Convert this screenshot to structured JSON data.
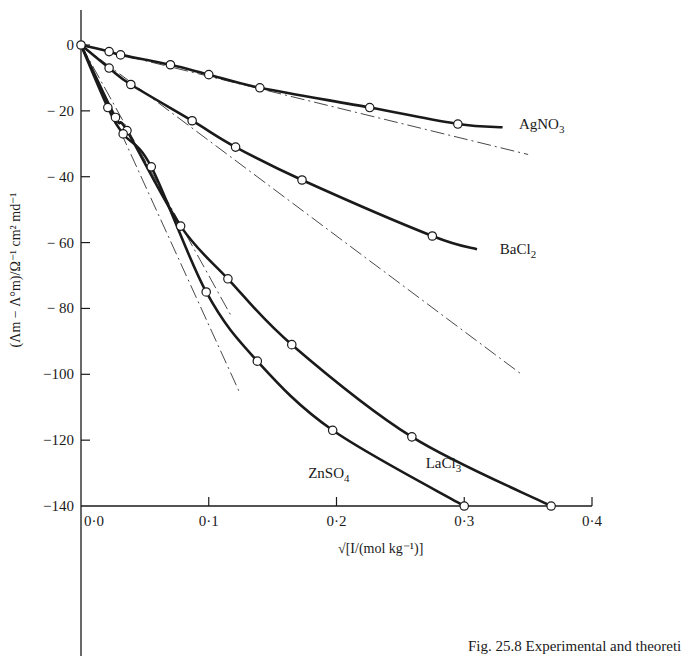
{
  "chart_data": {
    "type": "line",
    "title": "",
    "xlabel": "√[I/(mol kg⁻¹)]",
    "ylabel": "(Λm − Λ°m)/Ω⁻¹ cm² md⁻¹",
    "xlim": [
      0.0,
      0.4
    ],
    "ylim": [
      -140,
      0
    ],
    "x_ticks": [
      0.0,
      0.1,
      0.2,
      0.3,
      0.4
    ],
    "x_tick_labels": [
      "0·0",
      "0·1",
      "0·2",
      "0·3",
      "0·4"
    ],
    "y_ticks": [
      0,
      -20,
      -40,
      -60,
      -80,
      -100,
      -120,
      -140
    ],
    "y_tick_labels": [
      "0",
      "− 20",
      "− 40",
      "− 60",
      "− 80",
      "−100",
      "−120",
      "−140"
    ],
    "grid": false,
    "legend": "inline labels at curve ends",
    "series": [
      {
        "name": "AgNO3",
        "label_main": "AgNO",
        "label_sub": "3",
        "marker": "open-circle",
        "x": [
          0.0,
          0.022,
          0.031,
          0.07,
          0.1,
          0.14,
          0.226,
          0.295,
          0.33
        ],
        "values": [
          0,
          -2,
          -3,
          -6,
          -9,
          -13,
          -19,
          -24,
          -25
        ],
        "markers_x": [
          0.0,
          0.022,
          0.031,
          0.07,
          0.1,
          0.14,
          0.226,
          0.295
        ],
        "markers_y": [
          0,
          -2,
          -3,
          -6,
          -9,
          -13,
          -19,
          -24
        ],
        "theory_slope": -95,
        "theory_x_end": 0.35
      },
      {
        "name": "BaCl2",
        "label_main": "BaCl",
        "label_sub": "2",
        "marker": "open-circle",
        "x": [
          0.0,
          0.022,
          0.039,
          0.087,
          0.121,
          0.173,
          0.275,
          0.31
        ],
        "values": [
          0,
          -7,
          -12,
          -23,
          -31,
          -41,
          -58,
          -62
        ],
        "markers_x": [
          0.022,
          0.039,
          0.087,
          0.121,
          0.173,
          0.275
        ],
        "markers_y": [
          -7,
          -12,
          -23,
          -31,
          -41,
          -58
        ],
        "theory_slope": -290,
        "theory_x_end": 0.345
      },
      {
        "name": "LaCl3",
        "label_main": "LaCl",
        "label_sub": "3",
        "marker": "open-circle",
        "x": [
          0.0,
          0.027,
          0.036,
          0.078,
          0.115,
          0.165,
          0.259,
          0.368
        ],
        "values": [
          0,
          -22,
          -26,
          -55,
          -71,
          -91,
          -119,
          -140
        ],
        "markers_x": [
          0.027,
          0.036,
          0.078,
          0.115,
          0.165,
          0.259,
          0.368
        ],
        "markers_y": [
          -22,
          -26,
          -55,
          -71,
          -91,
          -119,
          -140
        ],
        "theory_slope": -700,
        "theory_x_end": 0.118
      },
      {
        "name": "ZnSO4",
        "label_main": "ZnSO",
        "label_sub": "4",
        "marker": "open-circle",
        "x": [
          0.0,
          0.021,
          0.033,
          0.055,
          0.098,
          0.138,
          0.197,
          0.3
        ],
        "values": [
          0,
          -19,
          -27,
          -37,
          -75,
          -96,
          -117,
          -140
        ],
        "markers_x": [
          0.021,
          0.033,
          0.055,
          0.098,
          0.138,
          0.197,
          0.3
        ],
        "markers_y": [
          -19,
          -27,
          -37,
          -75,
          -96,
          -117,
          -140
        ],
        "theory_slope": -850,
        "theory_x_end": 0.124
      }
    ],
    "annotations": [
      {
        "text": "AgNO3",
        "x": 0.335,
        "y": -24
      },
      {
        "text": "BaCl2",
        "x": 0.32,
        "y": -62
      },
      {
        "text": "LaCl3",
        "x": 0.262,
        "y": -127
      },
      {
        "text": "ZnSO4",
        "x": 0.17,
        "y": -130
      }
    ],
    "theory_line_style": "dash-dot (Debye–Hückel–Onsager limiting law)"
  },
  "caption": "Fig. 25.8  Experimental and theoreti"
}
